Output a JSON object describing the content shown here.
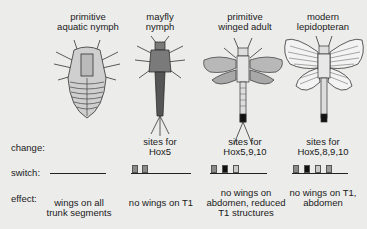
{
  "columns": [
    {
      "id": "primitive-aquatic-nymph",
      "title_lines": [
        "primitive",
        "aquatic nymph"
      ],
      "change_lines": [],
      "switch_sites": [],
      "effect_lines": [
        "wings on all",
        "trunk segments"
      ]
    },
    {
      "id": "mayfly-nymph",
      "title_lines": [
        "mayfly",
        "nymph"
      ],
      "change_lines": [
        "sites for",
        "Hox5"
      ],
      "switch_sites": [
        {
          "color": "#8a8a8a"
        },
        {
          "color": "#8a8a8a"
        }
      ],
      "effect_lines": [
        "no wings on T1"
      ]
    },
    {
      "id": "primitive-winged-adult",
      "title_lines": [
        "primitive",
        "winged adult"
      ],
      "change_lines": [
        "sites for",
        "Hox5,9,10"
      ],
      "switch_sites": [
        {
          "color": "#8a8a8a"
        },
        {
          "color": "#111111"
        },
        {
          "color": "#c9c9c9"
        }
      ],
      "effect_lines": [
        "no wings on",
        "abdomen, reduced",
        "T1 structures"
      ]
    },
    {
      "id": "modern-lepidopteran",
      "title_lines": [
        "modern",
        "lepidopteran"
      ],
      "change_lines": [
        "sites for",
        "Hox5,8,9,10"
      ],
      "switch_sites": [
        {
          "color": "#8a8a8a"
        },
        {
          "color": "#111111"
        },
        {
          "color": "#c9c9c9"
        },
        {
          "color": "#9a9a9a"
        }
      ],
      "effect_lines": [
        "no wings on T1,",
        "abdomen"
      ]
    }
  ],
  "row_labels": {
    "change": "change:",
    "switch": "switch:",
    "effect": "effect:"
  }
}
